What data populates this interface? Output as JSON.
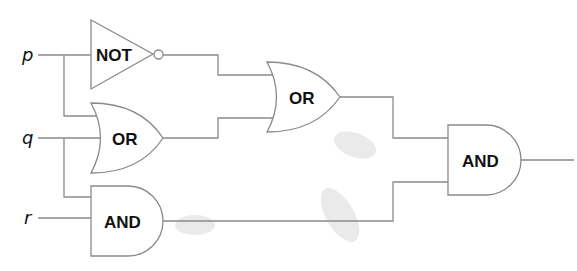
{
  "diagram": {
    "type": "logic-circuit",
    "inputs": [
      {
        "id": "p",
        "label": "p"
      },
      {
        "id": "q",
        "label": "q"
      },
      {
        "id": "r",
        "label": "r"
      }
    ],
    "gates": [
      {
        "id": "g1",
        "type": "NOT",
        "label": "NOT",
        "inputs": [
          "p"
        ]
      },
      {
        "id": "g2",
        "type": "OR",
        "label": "OR",
        "inputs": [
          "p",
          "q"
        ]
      },
      {
        "id": "g3",
        "type": "AND",
        "label": "AND",
        "inputs": [
          "q",
          "r"
        ]
      },
      {
        "id": "g4",
        "type": "OR",
        "label": "OR",
        "inputs": [
          "g1",
          "g2"
        ]
      },
      {
        "id": "g5",
        "type": "AND",
        "label": "AND",
        "inputs": [
          "g4",
          "g3"
        ]
      }
    ],
    "output": "g5",
    "colors": {
      "wire": "#8a8a8a",
      "text": "#111111",
      "background": "#ffffff"
    }
  }
}
